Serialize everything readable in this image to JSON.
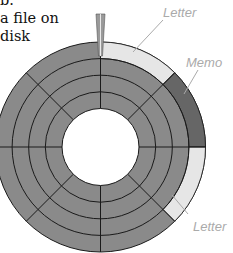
{
  "caption": {
    "lines": [
      "b.",
      "a file on",
      "disk"
    ]
  },
  "labels": {
    "letter_top": "Letter",
    "memo": "Memo",
    "letter_bottom": "Letter"
  },
  "colors": {
    "track": "#8a8a8a",
    "letter": "#e6e6e6",
    "memo": "#666666",
    "line": "#1a1a1a",
    "label": "#aaaaaa"
  }
}
